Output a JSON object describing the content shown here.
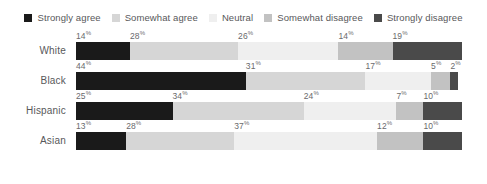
{
  "legend": {
    "items": [
      {
        "label": "Strongly agree",
        "color": "#1a1a1a",
        "icon": "square-swatch-icon"
      },
      {
        "label": "Somewhat agree",
        "color": "#d6d6d6",
        "icon": "square-swatch-icon"
      },
      {
        "label": "Neutral",
        "color": "#efefef",
        "icon": "square-swatch-icon"
      },
      {
        "label": "Somewhat disagree",
        "color": "#c2c2c2",
        "icon": "square-swatch-icon"
      },
      {
        "label": "Strongly disagree",
        "color": "#4a4a4a",
        "icon": "square-swatch-icon"
      }
    ]
  },
  "percent_symbol": "%",
  "chart_data": {
    "type": "bar",
    "orientation": "horizontal",
    "stacked": true,
    "normalized_to_100": true,
    "title": "",
    "subtitle": "",
    "xlabel": "",
    "ylabel": "",
    "xlim": [
      0,
      100
    ],
    "grid": false,
    "legend_position": "top-center",
    "categories": [
      "White",
      "Black",
      "Hispanic",
      "Asian"
    ],
    "series": [
      {
        "name": "Strongly agree",
        "color": "#1a1a1a",
        "values": [
          14,
          44,
          25,
          13
        ]
      },
      {
        "name": "Somewhat agree",
        "color": "#d6d6d6",
        "values": [
          28,
          31,
          34,
          28
        ]
      },
      {
        "name": "Neutral",
        "color": "#efefef",
        "values": [
          26,
          17,
          24,
          37
        ]
      },
      {
        "name": "Somewhat disagree",
        "color": "#c2c2c2",
        "values": [
          14,
          5,
          7,
          12
        ]
      },
      {
        "name": "Strongly disagree",
        "color": "#4a4a4a",
        "values": [
          19,
          2,
          10,
          10
        ]
      }
    ],
    "rows": [
      {
        "category": "White",
        "segments": [
          {
            "name": "Strongly agree",
            "value": 14,
            "label": "14",
            "color": "#1a1a1a"
          },
          {
            "name": "Somewhat agree",
            "value": 28,
            "label": "28",
            "color": "#d6d6d6"
          },
          {
            "name": "Neutral",
            "value": 26,
            "label": "26",
            "color": "#efefef"
          },
          {
            "name": "Somewhat disagree",
            "value": 14,
            "label": "14",
            "color": "#c2c2c2"
          },
          {
            "name": "Strongly disagree",
            "value": 19,
            "label": "19",
            "color": "#4a4a4a"
          }
        ]
      },
      {
        "category": "Black",
        "segments": [
          {
            "name": "Strongly agree",
            "value": 44,
            "label": "44",
            "color": "#1a1a1a"
          },
          {
            "name": "Somewhat agree",
            "value": 31,
            "label": "31",
            "color": "#d6d6d6"
          },
          {
            "name": "Neutral",
            "value": 17,
            "label": "17",
            "color": "#efefef"
          },
          {
            "name": "Somewhat disagree",
            "value": 5,
            "label": "5",
            "color": "#c2c2c2"
          },
          {
            "name": "Strongly disagree",
            "value": 2,
            "label": "2",
            "color": "#4a4a4a"
          }
        ]
      },
      {
        "category": "Hispanic",
        "segments": [
          {
            "name": "Strongly agree",
            "value": 25,
            "label": "25",
            "color": "#1a1a1a"
          },
          {
            "name": "Somewhat agree",
            "value": 34,
            "label": "34",
            "color": "#d6d6d6"
          },
          {
            "name": "Neutral",
            "value": 24,
            "label": "24",
            "color": "#efefef"
          },
          {
            "name": "Somewhat disagree",
            "value": 7,
            "label": "7",
            "color": "#c2c2c2"
          },
          {
            "name": "Strongly disagree",
            "value": 10,
            "label": "10",
            "color": "#4a4a4a"
          }
        ]
      },
      {
        "category": "Asian",
        "segments": [
          {
            "name": "Strongly agree",
            "value": 13,
            "label": "13",
            "color": "#1a1a1a"
          },
          {
            "name": "Somewhat agree",
            "value": 28,
            "label": "28",
            "color": "#d6d6d6"
          },
          {
            "name": "Neutral",
            "value": 37,
            "label": "37",
            "color": "#efefef"
          },
          {
            "name": "Somewhat disagree",
            "value": 12,
            "label": "12",
            "color": "#c2c2c2"
          },
          {
            "name": "Strongly disagree",
            "value": 10,
            "label": "10",
            "color": "#4a4a4a"
          }
        ]
      }
    ]
  }
}
